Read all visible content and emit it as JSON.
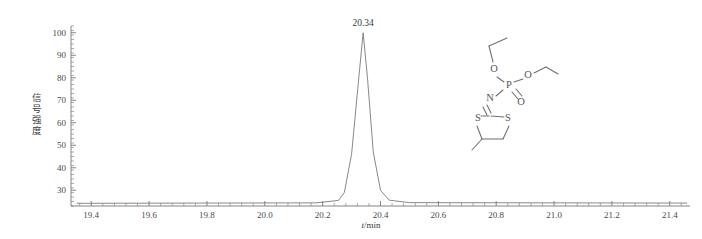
{
  "chart_data": {
    "type": "line",
    "title": "",
    "subtitle": "",
    "xlabel": "t/min",
    "xlabel_italic_part": "t",
    "xlabel_rest": "/min",
    "ylabel": "信号强度",
    "xlim": [
      19.33,
      21.47
    ],
    "ylim": [
      23,
      103
    ],
    "grid": false,
    "legend": "none",
    "x_major_ticks": [
      19.4,
      19.6,
      19.8,
      20.0,
      20.2,
      20.4,
      20.6,
      20.8,
      21.0,
      21.2,
      21.4
    ],
    "x_tick_labels": [
      "19.4",
      "19.6",
      "19.8",
      "20.0",
      "20.2",
      "20.4",
      "20.6",
      "20.8",
      "21.0",
      "21.2",
      "21.4"
    ],
    "x_minor_per_interval": 4,
    "y_major_ticks": [
      30,
      40,
      50,
      60,
      70,
      80,
      90,
      100
    ],
    "y_tick_labels": [
      "30",
      "40",
      "50",
      "60",
      "70",
      "80",
      "90",
      "100"
    ],
    "y_minor_per_interval": 4,
    "series": [
      {
        "name": "chromatogram",
        "color": "#7a7a7a",
        "x": [
          19.35,
          20.18,
          20.255,
          20.275,
          20.3,
          20.325,
          20.34,
          20.355,
          20.375,
          20.4,
          20.43,
          20.5,
          21.46
        ],
        "values": [
          24.2,
          24.4,
          25.5,
          29.0,
          46.0,
          80.0,
          100.0,
          80.0,
          47.0,
          30.0,
          25.6,
          24.5,
          24.3
        ]
      }
    ],
    "annotations": [
      {
        "name": "peak-retention-time",
        "text": "20.34",
        "x": 20.34,
        "y": 100
      }
    ]
  },
  "molecule": {
    "name": "mephosfolan-structure",
    "atom_labels": [
      "O",
      "O",
      "P",
      "O",
      "N",
      "S",
      "S"
    ],
    "atoms": [
      {
        "label": "O",
        "x": 494,
        "y": 70
      },
      {
        "label": "O",
        "x": 528,
        "y": 76
      },
      {
        "label": "P",
        "x": 509,
        "y": 86
      },
      {
        "label": "O",
        "x": 521,
        "y": 103
      },
      {
        "label": "N",
        "x": 490,
        "y": 99
      },
      {
        "label": "S",
        "x": 478,
        "y": 119
      },
      {
        "label": "S",
        "x": 508,
        "y": 119
      }
    ]
  }
}
